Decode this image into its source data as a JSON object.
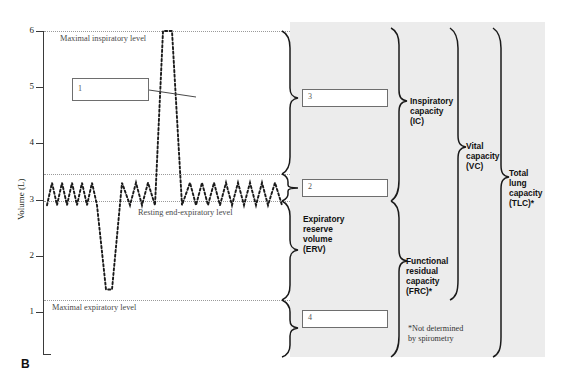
{
  "figure": {
    "panel_letter": "B",
    "background_panel_color": "#ececec",
    "trace_color": "#1a1a1a"
  },
  "axis": {
    "title": "Volume (L)",
    "unit": "L",
    "ticks": [
      {
        "value": 6,
        "label": "6",
        "y": 31
      },
      {
        "value": 5,
        "label": "5",
        "y": 87
      },
      {
        "value": 4,
        "label": "4",
        "y": 143
      },
      {
        "value": 3,
        "label": "3",
        "y": 200
      },
      {
        "value": 2,
        "label": "2",
        "y": 256
      },
      {
        "value": 1,
        "label": "1",
        "y": 312
      }
    ],
    "range": [
      0,
      6.2
    ]
  },
  "reference_levels": [
    {
      "name": "maximal-inspiratory-level",
      "label": "Maximal inspiratory level",
      "value": 6.0,
      "y": 31,
      "label_x": 60,
      "label_y": 34
    },
    {
      "name": "tidal-peak-level",
      "label": "",
      "value": 3.3,
      "y": 174,
      "label_x": 0,
      "label_y": 0
    },
    {
      "name": "resting-end-expiratory-level",
      "label": "Resting end-expiratory level",
      "value": 2.9,
      "y": 201,
      "label_x": 138,
      "label_y": 208
    },
    {
      "name": "maximal-expiratory-level",
      "label": "Maximal expiratory level",
      "value": 1.4,
      "y": 300,
      "label_x": 52,
      "label_y": 303
    }
  ],
  "numbered_boxes": [
    {
      "id": "1",
      "label": "1",
      "x": 72,
      "y": 78,
      "w": 77,
      "h": 23,
      "leader_to_x": 196,
      "leader_to_y": 97
    },
    {
      "id": "3",
      "label": "3",
      "x": 302,
      "y": 89,
      "w": 86,
      "h": 18
    },
    {
      "id": "2",
      "label": "2",
      "x": 302,
      "y": 179,
      "w": 86,
      "h": 18
    },
    {
      "id": "4",
      "label": "4",
      "x": 302,
      "y": 310,
      "w": 86,
      "h": 18
    }
  ],
  "capacity_labels": [
    {
      "name": "expiratory-reserve-volume",
      "lines": [
        "Expiratory",
        "reserve",
        "volume",
        "(ERV)"
      ],
      "x": 303,
      "y": 214
    },
    {
      "name": "inspiratory-capacity",
      "lines": [
        "Inspiratory",
        "capacity",
        "(IC)"
      ],
      "x": 410,
      "y": 98
    },
    {
      "name": "functional-residual-capacity",
      "lines": [
        "Functional",
        "residual",
        "capacity",
        "(FRC)*"
      ],
      "x": 406,
      "y": 256
    },
    {
      "name": "vital-capacity",
      "lines": [
        "Vital",
        "capacity",
        "(VC)"
      ],
      "x": 466,
      "y": 141
    },
    {
      "name": "total-lung-capacity",
      "lines": [
        "Total",
        "lung",
        "capacity",
        "(TLC)*"
      ],
      "x": 509,
      "y": 168
    }
  ],
  "footnote": {
    "lines": [
      "*Not determined",
      "by spirometry"
    ],
    "x": 408,
    "y": 324
  },
  "chart_data": {
    "type": "line",
    "title": "",
    "xlabel": "",
    "ylabel": "Volume (L)",
    "ylim": [
      0,
      6.2
    ],
    "grid": false,
    "legend": "none",
    "series": [
      {
        "name": "spirogram",
        "style": "dotted",
        "description": "Tidal breathing oscillating between 2.9 L and 3.3 L, interrupted by a maximal expiration to 1.4 L and a maximal inspiration to 6.0 L.",
        "points": [
          [
            47,
            2.9
          ],
          [
            52,
            3.3
          ],
          [
            57,
            2.9
          ],
          [
            62,
            3.3
          ],
          [
            67,
            2.9
          ],
          [
            72,
            3.3
          ],
          [
            77,
            2.9
          ],
          [
            82,
            3.3
          ],
          [
            87,
            2.9
          ],
          [
            92,
            3.3
          ],
          [
            97,
            2.9
          ],
          [
            106,
            1.4
          ],
          [
            112,
            1.4
          ],
          [
            122,
            3.3
          ],
          [
            130,
            2.9
          ],
          [
            136,
            3.3
          ],
          [
            142,
            2.9
          ],
          [
            148,
            3.3
          ],
          [
            155,
            2.9
          ],
          [
            163,
            6.0
          ],
          [
            172,
            6.0
          ],
          [
            182,
            2.9
          ],
          [
            190,
            3.3
          ],
          [
            196,
            2.9
          ],
          [
            202,
            3.3
          ],
          [
            208,
            2.9
          ],
          [
            214,
            3.3
          ],
          [
            220,
            2.9
          ],
          [
            226,
            3.3
          ],
          [
            232,
            2.9
          ],
          [
            238,
            3.3
          ],
          [
            244,
            2.9
          ],
          [
            250,
            3.3
          ],
          [
            256,
            2.9
          ],
          [
            262,
            3.3
          ],
          [
            268,
            2.9
          ],
          [
            275,
            3.3
          ],
          [
            282,
            2.9
          ]
        ]
      }
    ]
  }
}
